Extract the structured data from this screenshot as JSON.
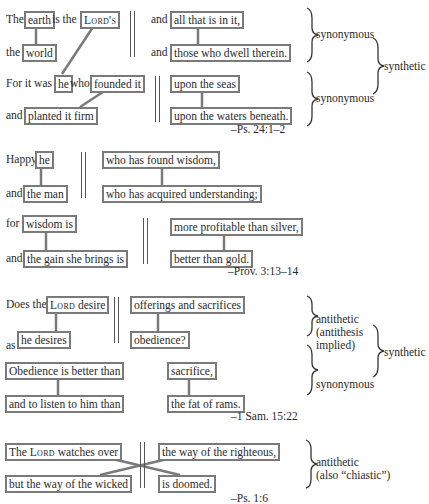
{
  "examples": [
    {
      "reference": "–Ps. 24:1–2",
      "lines": [
        {
          "pre1": "The",
          "box1": "earth",
          "mid1": "is the",
          "box2": "Lord's",
          "post_box2": "",
          "right_pre": "and",
          "right_box": "all that is in it,"
        },
        {
          "pre1": "the",
          "box1": "world",
          "right_pre": "and",
          "right_box": "those who dwell therein."
        },
        {
          "pre1": "For it was",
          "box1": "he",
          "mid1": "who",
          "box2": "founded it",
          "right_box": "upon the seas"
        },
        {
          "pre1": "and",
          "box1": "planted it firm",
          "right_box": "upon the waters beneath."
        }
      ],
      "labels": [
        "synonymous",
        "synonymous",
        "synthetic"
      ]
    },
    {
      "reference": "–Prov. 3:13–14",
      "lines": [
        {
          "pre1": "Happy",
          "box1": "he",
          "right_box": "who has found wisdom,"
        },
        {
          "pre1": "and",
          "box1": "the man",
          "right_box": "who has acquired understanding;"
        },
        {
          "pre1": "for",
          "box1": "wisdom is",
          "right_box": "more profitable than silver,"
        },
        {
          "pre1": "and",
          "box1": "the gain she brings is",
          "right_box": "better than gold."
        }
      ]
    },
    {
      "reference": "–1 Sam. 15:22",
      "lines": [
        {
          "pre1": "Does the",
          "box1_sc": "Lord",
          "box1_rest": " desire",
          "right_box": "offerings and sacrifices"
        },
        {
          "pre1": "as",
          "box1": "he desires",
          "right_box": "obedience?"
        },
        {
          "box1": "Obedience is better than",
          "right_box": "sacrifice,"
        },
        {
          "box1": "and to listen to him than",
          "right_box": "the fat of rams."
        }
      ],
      "labels": [
        "antithetic",
        "(antithesis",
        "implied)",
        "synonymous",
        "synthetic"
      ]
    },
    {
      "reference": "–Ps. 1:6",
      "lines": [
        {
          "box1_pre": "The ",
          "box1_sc": "Lord",
          "box1_rest": " watches over",
          "right_box": "the way of the righteous,"
        },
        {
          "box1": "but the way of the wicked",
          "right_box": "is doomed."
        }
      ],
      "labels": [
        "antithetic",
        "(also “chiastic”)"
      ]
    }
  ],
  "colors": {
    "box_border": "#7a7a7a",
    "connector": "#7a7a7a",
    "text": "#2a2a2a"
  }
}
